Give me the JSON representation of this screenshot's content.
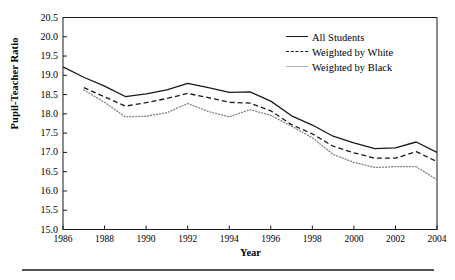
{
  "chart_data": {
    "type": "line",
    "title": "",
    "xlabel": "Year",
    "ylabel": "Pupil-Teacher Ratio",
    "xlim": [
      1986,
      2004
    ],
    "ylim": [
      15.0,
      20.5
    ],
    "grid": false,
    "legend_position": "top-right",
    "x": [
      1986,
      1987,
      1988,
      1989,
      1990,
      1991,
      1992,
      1993,
      1994,
      1995,
      1996,
      1997,
      1998,
      1999,
      2000,
      2001,
      2002,
      2003,
      2004
    ],
    "xticks": [
      1986,
      1988,
      1990,
      1992,
      1994,
      1996,
      1998,
      2000,
      2002,
      2004
    ],
    "xticklabels": [
      "1986",
      "1988",
      "1990",
      "1992",
      "1994",
      "1996",
      "1998",
      "2000",
      "2002",
      "2004"
    ],
    "yticks": [
      15.0,
      15.5,
      16.0,
      16.5,
      17.0,
      17.5,
      18.0,
      18.5,
      19.0,
      19.5,
      20.0,
      20.5
    ],
    "yticklabels": [
      "15.0",
      "15.5",
      "16.0",
      "16.5",
      "17.0",
      "17.5",
      "18.0",
      "18.5",
      "19.0",
      "19.5",
      "20.0",
      "20.5"
    ],
    "series": [
      {
        "name": "All Students",
        "style": "solid",
        "color": "#1a1a1a",
        "values": [
          19.22,
          18.95,
          18.72,
          18.45,
          18.52,
          18.62,
          18.79,
          18.68,
          18.56,
          18.57,
          18.33,
          17.95,
          17.71,
          17.42,
          17.25,
          17.1,
          17.12,
          17.27,
          17.0
        ]
      },
      {
        "name": "Weighted by White",
        "style": "dashed",
        "color": "#1a1a1a",
        "values": [
          null,
          18.68,
          18.44,
          18.2,
          18.29,
          18.4,
          18.53,
          18.42,
          18.3,
          18.28,
          18.08,
          17.72,
          17.48,
          17.16,
          16.99,
          16.85,
          16.85,
          17.02,
          16.76
        ]
      },
      {
        "name": "Weighted by Black",
        "style": "dotted",
        "color": "#808080",
        "values": [
          null,
          18.62,
          18.3,
          17.92,
          17.94,
          18.03,
          18.27,
          18.06,
          17.92,
          18.11,
          17.96,
          17.68,
          17.38,
          16.95,
          16.74,
          16.61,
          16.63,
          16.63,
          16.29
        ]
      }
    ]
  },
  "legend": {
    "items": [
      {
        "label": "All Students",
        "swatch": "solid-line-swatch"
      },
      {
        "label": "Weighted by White",
        "swatch": "dashed-line-swatch"
      },
      {
        "label": "Weighted by Black",
        "swatch": "dotted-line-swatch"
      }
    ]
  }
}
